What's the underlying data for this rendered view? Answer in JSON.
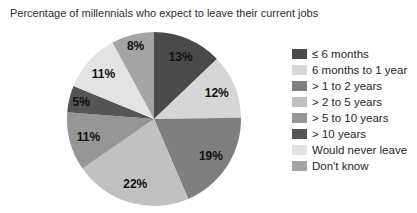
{
  "chart_data": {
    "type": "pie",
    "title": "Percentage of millennials who expect to leave their current jobs",
    "legend_position": "right",
    "total": 101,
    "slices": [
      {
        "label": "≤ 6 months",
        "value": 13,
        "display": "13%",
        "color": "#4a4a4a"
      },
      {
        "label": "6 months to 1 year",
        "value": 12,
        "display": "12%",
        "color": "#d6d6d6"
      },
      {
        "label": "> 1 to 2 years",
        "value": 19,
        "display": "19%",
        "color": "#7f7f7f"
      },
      {
        "label": "> 2 to 5 years",
        "value": 22,
        "display": "22%",
        "color": "#c1c1c1"
      },
      {
        "label": "> 5 to 10 years",
        "value": 11,
        "display": "11%",
        "color": "#969696"
      },
      {
        "label": "> 10 years",
        "value": 5,
        "display": "5%",
        "color": "#555555"
      },
      {
        "label": "Would never leave",
        "value": 11,
        "display": "11%",
        "color": "#e3e3e3"
      },
      {
        "label": "Don't know",
        "value": 8,
        "display": "8%",
        "color": "#a4a4a4"
      }
    ]
  }
}
